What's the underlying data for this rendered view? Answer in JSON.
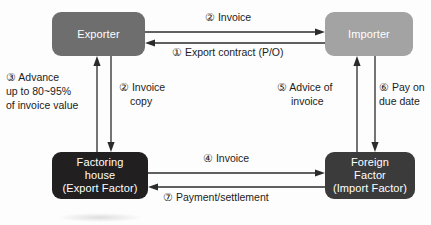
{
  "diagram": {
    "type": "flow-diagram",
    "colors": {
      "exporter": "#6e6e6e",
      "importer": "#a3a3a3",
      "factoring_house": "#211f1f",
      "foreign_factor": "#3b3b3b",
      "arrow": "#2b2b2b",
      "text_on_node": "#ffffff",
      "text_label": "#1c1c1c",
      "background": "#fdfdfd"
    }
  },
  "nodes": {
    "exporter": {
      "lines": [
        "Exporter"
      ]
    },
    "importer": {
      "lines": [
        "Importer"
      ]
    },
    "factoring_house": {
      "lines": [
        "Factoring",
        "house",
        "(Export Factor)"
      ]
    },
    "foreign_factor": {
      "lines": [
        "Foreign",
        "Factor",
        "(Import Factor)"
      ]
    }
  },
  "labels": {
    "step1": {
      "lines": [
        "① Export contract (P/O)"
      ]
    },
    "step2_top": {
      "lines": [
        "② Invoice"
      ]
    },
    "step2_copy": {
      "lines": [
        "② Invoice",
        "copy"
      ]
    },
    "step3_advance": {
      "lines": [
        "③ Advance",
        "up to 80~95%",
        "of invoice value"
      ]
    },
    "step4": {
      "lines": [
        "④  Invoice"
      ]
    },
    "step5": {
      "lines": [
        "⑤ Advice of",
        "invoice"
      ]
    },
    "step6": {
      "lines": [
        "⑥ Pay on",
        "due date"
      ]
    },
    "step7": {
      "lines": [
        "⑦ Payment/settlement"
      ]
    }
  }
}
